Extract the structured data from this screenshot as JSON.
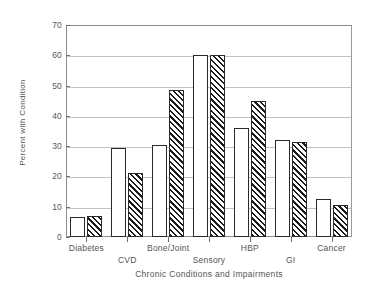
{
  "chart_data": {
    "type": "bar",
    "title": "",
    "xlabel": "Chronic Conditions and Impairments",
    "ylabel": "Percent with Condition",
    "categories": [
      "Diabetes",
      "CVD",
      "Bone/Joint",
      "Sensory",
      "HBP",
      "GI",
      "Cancer"
    ],
    "series": [
      {
        "name": "open",
        "values": [
          6.5,
          29.5,
          30.5,
          60.0,
          36.0,
          32.0,
          12.5
        ]
      },
      {
        "name": "hatched",
        "values": [
          7.0,
          21.0,
          48.5,
          60.0,
          45.0,
          31.5,
          10.5
        ]
      }
    ],
    "ylim": [
      0,
      70
    ],
    "ytick_labels": [
      "0",
      "10",
      "20",
      "30",
      "40",
      "50",
      "60",
      "70"
    ],
    "ytick_values": [
      0,
      10,
      20,
      30,
      40,
      50,
      60,
      70
    ],
    "grid": true,
    "legend": "none",
    "colors": {
      "axis": "#8d8d8d",
      "grid": "#c2c2c2",
      "bar_outline": "#2a2a2a",
      "bar_open_fill": "#ffffff",
      "bar_hatch": "#1b1b1b",
      "text": "#555555",
      "background": "#ffffff"
    }
  }
}
